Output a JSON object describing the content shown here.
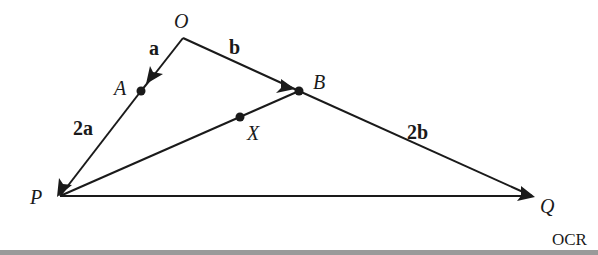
{
  "diagram": {
    "points": {
      "O": {
        "label": "O",
        "x": 183,
        "y": 38
      },
      "A": {
        "label": "A",
        "x": 141,
        "y": 91
      },
      "B": {
        "label": "B",
        "x": 299,
        "y": 91
      },
      "X": {
        "label": "X",
        "x": 240,
        "y": 117
      },
      "P": {
        "label": "P",
        "x": 60,
        "y": 196
      },
      "Q": {
        "label": "Q",
        "x": 532,
        "y": 196
      }
    },
    "edges": [
      {
        "from": "O",
        "to": "A",
        "label": "a",
        "arrow": true
      },
      {
        "from": "A",
        "to": "P",
        "label": "2a",
        "arrow": true
      },
      {
        "from": "O",
        "to": "B",
        "label": "b",
        "arrow": true
      },
      {
        "from": "B",
        "to": "Q",
        "label": "2b",
        "arrow": true
      },
      {
        "from": "B",
        "to": "P",
        "label": "",
        "arrow": false
      },
      {
        "from": "P",
        "to": "Q",
        "label": "",
        "arrow": false
      }
    ],
    "edge_labels": {
      "a": "a",
      "b": "b",
      "two_a": "2a",
      "two_b": "2b"
    },
    "source": "OCR",
    "line_color": "#1a1a1a",
    "footer_bar_color": "#9a9a9a"
  }
}
